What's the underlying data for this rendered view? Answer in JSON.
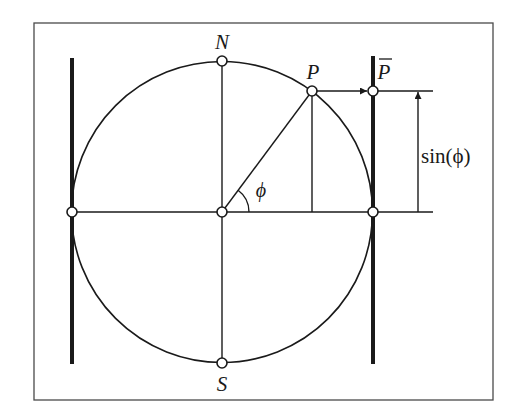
{
  "diagram": {
    "colors": {
      "stroke": "#1a1a1a",
      "background": "#ffffff",
      "node_fill": "#ffffff"
    },
    "labels": {
      "north": "N",
      "south": "S",
      "point": "P",
      "projected_point": "P",
      "angle": "ϕ",
      "sin_label": "sin(ϕ)"
    },
    "geometry": {
      "frame": {
        "x": 34,
        "y": 23,
        "w": 459,
        "h": 377
      },
      "circle": {
        "cx": 222,
        "cy": 212,
        "r": 150
      },
      "angle_deg": 53.4,
      "tangent_lines_x": [
        72,
        373
      ],
      "tangent_lines_y_range": [
        57,
        364
      ]
    },
    "nodes": [
      {
        "id": "N",
        "x": 222,
        "y": 61
      },
      {
        "id": "S",
        "x": 222,
        "y": 363
      },
      {
        "id": "center",
        "x": 222,
        "y": 212
      },
      {
        "id": "west",
        "x": 72,
        "y": 212
      },
      {
        "id": "east",
        "x": 373,
        "y": 212
      },
      {
        "id": "P",
        "x": 312,
        "y": 91
      },
      {
        "id": "P_bar",
        "x": 373,
        "y": 91
      }
    ]
  }
}
